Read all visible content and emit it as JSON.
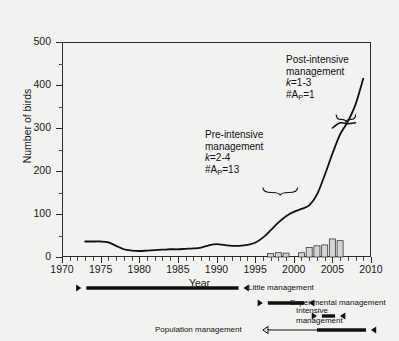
{
  "chart_data": {
    "type": "line",
    "title": "",
    "xlabel": "Year",
    "ylabel": "Number of birds",
    "xlim": [
      1970,
      2010
    ],
    "ylim": [
      0,
      500
    ],
    "xticks": [
      1970,
      1975,
      1980,
      1985,
      1990,
      1995,
      2000,
      2005,
      2010
    ],
    "xticklabels": [
      "1970",
      "1975",
      "1980",
      "1985",
      "1990",
      "1995",
      "2000",
      "2005",
      "2010"
    ],
    "x_minor_step": 1,
    "yticks": [
      0,
      100,
      200,
      300,
      400,
      500
    ],
    "yticklabels": [
      "0",
      "100",
      "200",
      "300",
      "400",
      "500"
    ],
    "y_minor_step": 50,
    "grid": false,
    "legend_position": "below-axes",
    "series": [
      {
        "name": "Number of birds",
        "type": "line",
        "color": "#111111",
        "x": [
          1973,
          1974,
          1975,
          1976,
          1977,
          1978,
          1979,
          1980,
          1981,
          1982,
          1983,
          1984,
          1985,
          1986,
          1987,
          1988,
          1989,
          1990,
          1991,
          1992,
          1993,
          1994,
          1995,
          1996,
          1997,
          1998,
          1999,
          2000,
          2001,
          2002,
          2003,
          2004,
          2005,
          2006,
          2007,
          2008,
          2009
        ],
        "values": [
          36,
          36,
          36,
          34,
          26,
          18,
          15,
          14,
          15,
          16,
          17,
          18,
          18,
          19,
          20,
          22,
          27,
          30,
          28,
          26,
          26,
          28,
          33,
          45,
          62,
          80,
          95,
          105,
          112,
          120,
          145,
          190,
          240,
          285,
          315,
          355,
          415
        ]
      },
      {
        "name": "Post-intensive plateau branch",
        "type": "line",
        "color": "#111111",
        "x": [
          2005,
          2006,
          2007,
          2008
        ],
        "values": [
          300,
          312,
          310,
          312
        ]
      },
      {
        "name": "Management actions per year",
        "type": "bar",
        "color": "#d4d4d4",
        "edge_color": "#3a3a3a",
        "x": [
          1997,
          1998,
          1999,
          2001,
          2002,
          2003,
          2004,
          2005,
          2006
        ],
        "values": [
          8,
          10,
          9,
          10,
          22,
          26,
          28,
          42,
          38
        ]
      }
    ],
    "annotations": [
      {
        "name": "post-intensive-management",
        "lines": [
          "Post-intensive",
          "management"
        ],
        "k": "k=1-3",
        "count": "#A",
        "count_sub": "P",
        "count_val": "=1",
        "bracket_x": [
          2005.5,
          2008.0
        ],
        "bracket_y": 320
      },
      {
        "name": "pre-intensive-management",
        "lines": [
          "Pre-intensive",
          "management"
        ],
        "k": "k=2-4",
        "count": "#A",
        "count_sub": "P",
        "count_val": "=13",
        "bracket_x": [
          1996.0,
          2000.5
        ],
        "bracket_y": 150
      }
    ],
    "period_bars": [
      {
        "name": "little-management",
        "label": "Little management",
        "start": 1972.5,
        "end": 1993.5,
        "style": "solid",
        "arrows": "both"
      },
      {
        "name": "experimental-management",
        "label": "Experimental management",
        "start": 1996.0,
        "end": 2002.0,
        "style": "solid",
        "arrows": "both"
      },
      {
        "name": "intensive-management",
        "label": "Intensive management",
        "label_lines": [
          "Intensive",
          "management"
        ],
        "start": 2003.0,
        "end": 2006.0,
        "style": "solid",
        "arrows": "both"
      },
      {
        "name": "population-management",
        "label": "Population management",
        "start": 1996.0,
        "end": 2010.0,
        "style": "hollow-then-solid",
        "split": 2003.0,
        "arrows": "both"
      }
    ]
  },
  "axes": {
    "y_title": "Number of birds",
    "x_title": "Year"
  },
  "colors": {
    "background": "#f2f2f0",
    "axis": "#2b2b2b",
    "line": "#111111",
    "bar_fill": "#d4d4d4",
    "bar_edge": "#3a3a3a",
    "text": "#111111"
  }
}
